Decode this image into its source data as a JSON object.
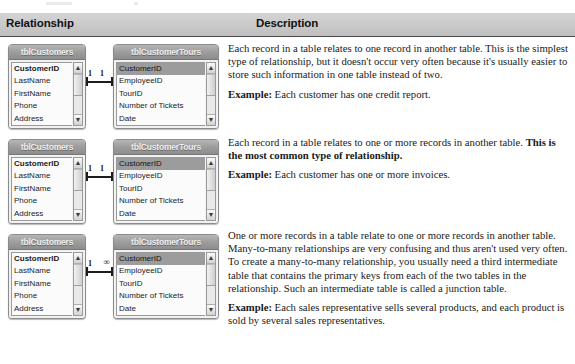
{
  "header": {
    "relationship_label": "Relationship",
    "description_label": "Description"
  },
  "tables": {
    "customers": {
      "title": "tblCustomers",
      "fields": [
        "CustomerID",
        "LastName",
        "FirstName",
        "Phone",
        "Address"
      ]
    },
    "customer_tours": {
      "title": "tblCustomerTours",
      "fields": [
        "CustomerID",
        "EmployeeID",
        "TourID",
        "Number of Tickets",
        "Date"
      ]
    }
  },
  "scrollbar": {
    "up_arrow": "▲",
    "down_arrow": "▼"
  },
  "rows": [
    {
      "id": "one-to-one",
      "cardinality_left": "1",
      "cardinality_right": "1",
      "description": {
        "paragraph": "Each record in a table relates to one record in another table. This is the simplest type of relationship, but it doesn't occur very often because it's usually easier to store such information in one table instead of two.",
        "example_label": "Example:",
        "example_text": " Each customer has one credit report."
      }
    },
    {
      "id": "one-to-many",
      "cardinality_left": "1",
      "cardinality_right": "1",
      "description": {
        "paragraph_plain": "Each record in a table relates to one or more records in another table. ",
        "paragraph_bold": "This is the most common type of relationship.",
        "example_label": "Example:",
        "example_text": " Each customer has one or more invoices."
      }
    },
    {
      "id": "many-to-many",
      "cardinality_left": "1",
      "cardinality_right": "∞",
      "description": {
        "paragraph": "One or more records in a table relate to one or more records in another table. Many-to-many relationships are very confusing and thus aren't used very often. To create a many-to-many relationship, you usually need a third intermediate table that contains the primary keys from each of the two tables in the relationship. Such an intermediate table is called a junction table.",
        "example_label": "Example:",
        "example_text": " Each sales representative sells several products, and each product is sold by several sales representatives."
      }
    }
  ]
}
